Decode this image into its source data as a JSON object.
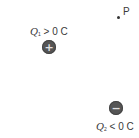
{
  "diagram": {
    "point_p": {
      "label": "P"
    },
    "charge_1": {
      "symbol": "Q",
      "subscript": "1",
      "relation": "> 0 C",
      "sign_glyph": "+",
      "icon": "plus-icon",
      "fill_color": "#555555"
    },
    "charge_2": {
      "symbol": "Q",
      "subscript": "2",
      "relation": "< 0 C",
      "sign_glyph": "−",
      "icon": "minus-icon",
      "fill_color": "#555555"
    }
  }
}
